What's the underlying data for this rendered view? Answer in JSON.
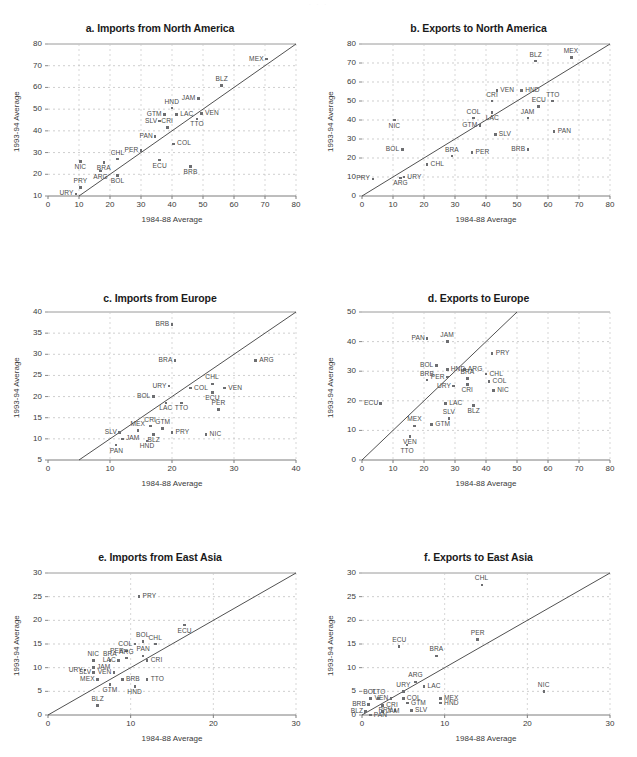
{
  "figure": {
    "top_note": "· · ·",
    "axis_x_label": "1984-88 Average",
    "axis_y_label": "1993-94 Average"
  },
  "chart_data": [
    {
      "id": "a",
      "type": "scatter",
      "title": "a. Imports from North America",
      "xlabel": "1984-88 Average",
      "ylabel": "1993-94 Average",
      "xlim": [
        0,
        80
      ],
      "ylim": [
        10,
        80
      ],
      "xticks": [
        0,
        10,
        20,
        30,
        40,
        50,
        60,
        70,
        80
      ],
      "yticks": [
        10,
        20,
        30,
        40,
        50,
        60,
        70,
        80
      ],
      "grid": true,
      "legend": "none",
      "reference_line": "45-degree identity line y = x",
      "points": [
        {
          "label": "MEX",
          "x": 70.5,
          "y": 73.0,
          "lp": "left"
        },
        {
          "label": "BLZ",
          "x": 56.0,
          "y": 61.0,
          "lp": "above"
        },
        {
          "label": "JAM",
          "x": 48.5,
          "y": 55.0,
          "lp": "left"
        },
        {
          "label": "HND",
          "x": 40.0,
          "y": 50.5,
          "lp": "above"
        },
        {
          "label": "VEN",
          "x": 49.5,
          "y": 48.0,
          "lp": "right"
        },
        {
          "label": "LAC",
          "x": 41.5,
          "y": 47.5,
          "lp": "right"
        },
        {
          "label": "GTM",
          "x": 37.5,
          "y": 47.5,
          "lp": "left"
        },
        {
          "label": "TTO",
          "x": 48.0,
          "y": 45.5,
          "lp": "below"
        },
        {
          "label": "SLV",
          "x": 36.0,
          "y": 44.5,
          "lp": "left"
        },
        {
          "label": "CRI",
          "x": 38.5,
          "y": 41.5,
          "lp": "above"
        },
        {
          "label": "PAN",
          "x": 34.5,
          "y": 37.5,
          "lp": "left"
        },
        {
          "label": "COL",
          "x": 40.5,
          "y": 34.0,
          "lp": "right"
        },
        {
          "label": "PER",
          "x": 30.0,
          "y": 31.0,
          "lp": "left"
        },
        {
          "label": "CHL",
          "x": 22.5,
          "y": 27.0,
          "lp": "above"
        },
        {
          "label": "ECU",
          "x": 36.0,
          "y": 26.5,
          "lp": "below"
        },
        {
          "label": "NIC",
          "x": 10.5,
          "y": 26.0,
          "lp": "below"
        },
        {
          "label": "BRA",
          "x": 18.0,
          "y": 25.5,
          "lp": "below"
        },
        {
          "label": "BRB",
          "x": 46.0,
          "y": 23.5,
          "lp": "below"
        },
        {
          "label": "ARG",
          "x": 17.0,
          "y": 21.5,
          "lp": "below"
        },
        {
          "label": "BOL",
          "x": 22.5,
          "y": 19.5,
          "lp": "below"
        },
        {
          "label": "PRY",
          "x": 10.5,
          "y": 14.0,
          "lp": "above"
        },
        {
          "label": "URY",
          "x": 9.0,
          "y": 11.0,
          "lp": "left"
        }
      ]
    },
    {
      "id": "b",
      "type": "scatter",
      "title": "b. Exports to North America",
      "xlabel": "1984-88 Average",
      "ylabel": "1993-94 Average",
      "xlim": [
        0,
        80
      ],
      "ylim": [
        0,
        80
      ],
      "xticks": [
        0,
        10,
        20,
        30,
        40,
        50,
        60,
        70,
        80
      ],
      "yticks": [
        0,
        10,
        20,
        30,
        40,
        50,
        60,
        70,
        80
      ],
      "grid": true,
      "legend": "none",
      "reference_line": "45-degree identity line y = x",
      "points": [
        {
          "label": "MEX",
          "x": 67.5,
          "y": 73.0,
          "lp": "above"
        },
        {
          "label": "BLZ",
          "x": 56.0,
          "y": 71.0,
          "lp": "above"
        },
        {
          "label": "HND",
          "x": 51.5,
          "y": 55.5,
          "lp": "right"
        },
        {
          "label": "VEN",
          "x": 43.5,
          "y": 55.5,
          "lp": "right"
        },
        {
          "label": "CRI",
          "x": 42.0,
          "y": 50.0,
          "lp": "above"
        },
        {
          "label": "TTO",
          "x": 61.5,
          "y": 50.0,
          "lp": "above"
        },
        {
          "label": "ECU",
          "x": 57.0,
          "y": 47.0,
          "lp": "above"
        },
        {
          "label": "LAC",
          "x": 42.0,
          "y": 44.0,
          "lp": "below"
        },
        {
          "label": "JAM",
          "x": 53.5,
          "y": 41.0,
          "lp": "above"
        },
        {
          "label": "COL",
          "x": 36.0,
          "y": 41.0,
          "lp": "above"
        },
        {
          "label": "NIC",
          "x": 10.5,
          "y": 40.0,
          "lp": "below"
        },
        {
          "label": "GTM",
          "x": 38.0,
          "y": 37.0,
          "lp": "left"
        },
        {
          "label": "PAN",
          "x": 62.0,
          "y": 34.0,
          "lp": "right"
        },
        {
          "label": "SLV",
          "x": 43.0,
          "y": 32.5,
          "lp": "right"
        },
        {
          "label": "BOL",
          "x": 13.0,
          "y": 24.5,
          "lp": "left"
        },
        {
          "label": "BRB",
          "x": 53.5,
          "y": 24.5,
          "lp": "left"
        },
        {
          "label": "PER",
          "x": 35.5,
          "y": 23.0,
          "lp": "right"
        },
        {
          "label": "BRA",
          "x": 29.0,
          "y": 21.0,
          "lp": "above"
        },
        {
          "label": "CHL",
          "x": 21.0,
          "y": 16.5,
          "lp": "right"
        },
        {
          "label": "URY",
          "x": 13.5,
          "y": 10.0,
          "lp": "right"
        },
        {
          "label": "ARG",
          "x": 12.5,
          "y": 9.5,
          "lp": "below"
        },
        {
          "label": "PRY",
          "x": 3.5,
          "y": 9.0,
          "lp": "left"
        }
      ]
    },
    {
      "id": "c",
      "type": "scatter",
      "title": "c. Imports from Europe",
      "xlabel": "1984-88 Average",
      "ylabel": "1993-94 Average",
      "xlim": [
        0,
        40
      ],
      "ylim": [
        5,
        40
      ],
      "xticks": [
        0,
        10,
        20,
        30,
        40
      ],
      "yticks": [
        5,
        10,
        15,
        20,
        25,
        30,
        35,
        40
      ],
      "grid": true,
      "legend": "none",
      "reference_line": "45-degree identity line y = x",
      "points": [
        {
          "label": "BRB",
          "x": 20.0,
          "y": 37.0,
          "lp": "left"
        },
        {
          "label": "BRA",
          "x": 20.5,
          "y": 28.5,
          "lp": "left"
        },
        {
          "label": "ARG",
          "x": 33.5,
          "y": 28.5,
          "lp": "right"
        },
        {
          "label": "CHL",
          "x": 26.5,
          "y": 23.0,
          "lp": "above"
        },
        {
          "label": "URY",
          "x": 19.5,
          "y": 22.5,
          "lp": "left"
        },
        {
          "label": "COL",
          "x": 23.0,
          "y": 22.0,
          "lp": "right"
        },
        {
          "label": "VEN",
          "x": 28.5,
          "y": 22.0,
          "lp": "right"
        },
        {
          "label": "ECU",
          "x": 26.5,
          "y": 21.0,
          "lp": "below"
        },
        {
          "label": "BOL",
          "x": 17.0,
          "y": 20.0,
          "lp": "left"
        },
        {
          "label": "TTO",
          "x": 21.5,
          "y": 18.5,
          "lp": "below"
        },
        {
          "label": "LAC",
          "x": 19.0,
          "y": 18.5,
          "lp": "below"
        },
        {
          "label": "PER",
          "x": 27.5,
          "y": 17.0,
          "lp": "above"
        },
        {
          "label": "CRI",
          "x": 16.5,
          "y": 13.0,
          "lp": "above"
        },
        {
          "label": "GTM",
          "x": 18.5,
          "y": 12.5,
          "lp": "above"
        },
        {
          "label": "MEX",
          "x": 14.5,
          "y": 12.0,
          "lp": "above"
        },
        {
          "label": "BLZ",
          "x": 17.0,
          "y": 11.0,
          "lp": "below"
        },
        {
          "label": "PRY",
          "x": 20.0,
          "y": 11.5,
          "lp": "right"
        },
        {
          "label": "NIC",
          "x": 25.5,
          "y": 11.0,
          "lp": "right"
        },
        {
          "label": "SLV",
          "x": 11.5,
          "y": 11.5,
          "lp": "left"
        },
        {
          "label": "JAM",
          "x": 12.0,
          "y": 10.0,
          "lp": "right"
        },
        {
          "label": "HND",
          "x": 16.0,
          "y": 9.5,
          "lp": "below"
        },
        {
          "label": "PAN",
          "x": 11.0,
          "y": 8.5,
          "lp": "below"
        }
      ]
    },
    {
      "id": "d",
      "type": "scatter",
      "title": "d. Exports to Europe",
      "xlabel": "1984-88 Average",
      "ylabel": "1993-94 Average",
      "xlim": [
        0,
        80
      ],
      "ylim": [
        0,
        50
      ],
      "xticks": [
        0,
        10,
        20,
        30,
        40,
        50,
        60,
        70,
        80
      ],
      "yticks": [
        0,
        10,
        20,
        30,
        40,
        50
      ],
      "grid": true,
      "legend": "none",
      "reference_line": "45-degree identity line y = x",
      "points": [
        {
          "label": "PAN",
          "x": 21.0,
          "y": 41.0,
          "lp": "left"
        },
        {
          "label": "JAM",
          "x": 27.5,
          "y": 40.0,
          "lp": "above"
        },
        {
          "label": "PRY",
          "x": 42.0,
          "y": 36.0,
          "lp": "right"
        },
        {
          "label": "BOL",
          "x": 24.0,
          "y": 32.0,
          "lp": "left"
        },
        {
          "label": "HND",
          "x": 27.5,
          "y": 30.5,
          "lp": "right"
        },
        {
          "label": "ARG",
          "x": 33.0,
          "y": 30.5,
          "lp": "right"
        },
        {
          "label": "CHL",
          "x": 40.0,
          "y": 29.0,
          "lp": "right"
        },
        {
          "label": "PER",
          "x": 27.5,
          "y": 28.0,
          "lp": "left"
        },
        {
          "label": "BRA",
          "x": 34.0,
          "y": 27.5,
          "lp": "above"
        },
        {
          "label": "BRB",
          "x": 21.0,
          "y": 27.0,
          "lp": "above"
        },
        {
          "label": "COL",
          "x": 41.0,
          "y": 26.5,
          "lp": "right"
        },
        {
          "label": "CRI",
          "x": 34.0,
          "y": 25.5,
          "lp": "below"
        },
        {
          "label": "URY",
          "x": 29.5,
          "y": 25.0,
          "lp": "left"
        },
        {
          "label": "NIC",
          "x": 42.5,
          "y": 23.5,
          "lp": "right"
        },
        {
          "label": "ECU",
          "x": 6.0,
          "y": 19.0,
          "lp": "left"
        },
        {
          "label": "LAC",
          "x": 27.0,
          "y": 19.0,
          "lp": "right"
        },
        {
          "label": "BLZ",
          "x": 36.0,
          "y": 18.5,
          "lp": "below"
        },
        {
          "label": "SLV",
          "x": 28.0,
          "y": 14.0,
          "lp": "above"
        },
        {
          "label": "GTM",
          "x": 22.5,
          "y": 12.0,
          "lp": "right"
        },
        {
          "label": "MEX",
          "x": 17.0,
          "y": 11.5,
          "lp": "above"
        },
        {
          "label": "VEN",
          "x": 15.5,
          "y": 8.0,
          "lp": "below"
        },
        {
          "label": "TTO",
          "x": 14.5,
          "y": 5.0,
          "lp": "below"
        }
      ]
    },
    {
      "id": "e",
      "type": "scatter",
      "title": "e. Imports from East Asia",
      "xlabel": "1984-88 Average",
      "ylabel": "1993-94 Average",
      "xlim": [
        0,
        30
      ],
      "ylim": [
        0,
        30
      ],
      "xticks": [
        0,
        10,
        20,
        30
      ],
      "yticks": [
        0,
        5,
        10,
        15,
        20,
        25,
        30
      ],
      "grid": true,
      "legend": "none",
      "reference_line": "45-degree identity line y = x",
      "points": [
        {
          "label": "PRY",
          "x": 11.0,
          "y": 25.0,
          "lp": "right"
        },
        {
          "label": "ECU",
          "x": 16.5,
          "y": 19.0,
          "lp": "below"
        },
        {
          "label": "BOL",
          "x": 11.5,
          "y": 15.5,
          "lp": "above"
        },
        {
          "label": "CHL",
          "x": 13.0,
          "y": 15.0,
          "lp": "above"
        },
        {
          "label": "COL",
          "x": 10.5,
          "y": 15.0,
          "lp": "left"
        },
        {
          "label": "PER",
          "x": 9.5,
          "y": 13.5,
          "lp": "left"
        },
        {
          "label": "PAN",
          "x": 11.5,
          "y": 12.5,
          "lp": "above"
        },
        {
          "label": "ARG",
          "x": 9.5,
          "y": 12.0,
          "lp": "above"
        },
        {
          "label": "LAC",
          "x": 8.5,
          "y": 11.5,
          "lp": "left"
        },
        {
          "label": "CRI",
          "x": 12.0,
          "y": 11.5,
          "lp": "right"
        },
        {
          "label": "BRA",
          "x": 7.5,
          "y": 11.5,
          "lp": "above"
        },
        {
          "label": "NIC",
          "x": 5.5,
          "y": 11.5,
          "lp": "above"
        },
        {
          "label": "VEN",
          "x": 8.0,
          "y": 9.0,
          "lp": "left"
        },
        {
          "label": "JAM",
          "x": 5.5,
          "y": 10.0,
          "lp": "right"
        },
        {
          "label": "URY",
          "x": 4.5,
          "y": 9.5,
          "lp": "left"
        },
        {
          "label": "SLV",
          "x": 5.5,
          "y": 9.0,
          "lp": "left"
        },
        {
          "label": "MEX",
          "x": 6.0,
          "y": 7.5,
          "lp": "left"
        },
        {
          "label": "BRB",
          "x": 9.0,
          "y": 7.5,
          "lp": "right"
        },
        {
          "label": "TTO",
          "x": 12.0,
          "y": 7.5,
          "lp": "right"
        },
        {
          "label": "GTM",
          "x": 7.5,
          "y": 6.5,
          "lp": "below"
        },
        {
          "label": "HND",
          "x": 10.5,
          "y": 6.0,
          "lp": "below"
        },
        {
          "label": "BLZ",
          "x": 6.0,
          "y": 2.0,
          "lp": "above"
        }
      ]
    },
    {
      "id": "f",
      "type": "scatter",
      "title": "f. Exports to East Asia",
      "xlabel": "1984-88 Average",
      "ylabel": "1993-94 Average",
      "xlim": [
        0,
        30
      ],
      "ylim": [
        0,
        30
      ],
      "xticks": [
        0,
        10,
        20,
        30
      ],
      "yticks": [
        0,
        5,
        10,
        15,
        20,
        25,
        30
      ],
      "grid": true,
      "legend": "none",
      "reference_line": "45-degree identity line y = x",
      "points": [
        {
          "label": "CHL",
          "x": 14.5,
          "y": 27.5,
          "lp": "above"
        },
        {
          "label": "PER",
          "x": 14.0,
          "y": 16.0,
          "lp": "above"
        },
        {
          "label": "ECU",
          "x": 4.5,
          "y": 14.5,
          "lp": "above"
        },
        {
          "label": "BRA",
          "x": 9.0,
          "y": 12.5,
          "lp": "above"
        },
        {
          "label": "ARG",
          "x": 6.5,
          "y": 7.0,
          "lp": "above"
        },
        {
          "label": "LAC",
          "x": 7.5,
          "y": 6.0,
          "lp": "right"
        },
        {
          "label": "URY",
          "x": 5.0,
          "y": 5.0,
          "lp": "above"
        },
        {
          "label": "NIC",
          "x": 22.0,
          "y": 5.0,
          "lp": "above"
        },
        {
          "label": "MEX",
          "x": 9.5,
          "y": 3.5,
          "lp": "right"
        },
        {
          "label": "COL",
          "x": 5.0,
          "y": 3.5,
          "lp": "right"
        },
        {
          "label": "VEN",
          "x": 3.5,
          "y": 3.5,
          "lp": "left"
        },
        {
          "label": "TTO",
          "x": 2.0,
          "y": 3.5,
          "lp": "above"
        },
        {
          "label": "BOL",
          "x": 1.0,
          "y": 3.5,
          "lp": "above"
        },
        {
          "label": "HND",
          "x": 9.5,
          "y": 2.5,
          "lp": "right"
        },
        {
          "label": "GTM",
          "x": 5.5,
          "y": 2.5,
          "lp": "right"
        },
        {
          "label": "CRI",
          "x": 2.5,
          "y": 2.0,
          "lp": "right"
        },
        {
          "label": "BRB",
          "x": 0.8,
          "y": 2.2,
          "lp": "left"
        },
        {
          "label": "SLV",
          "x": 6.0,
          "y": 1.0,
          "lp": "right"
        },
        {
          "label": "PRY",
          "x": 4.0,
          "y": 1.0,
          "lp": "left"
        },
        {
          "label": "JAM",
          "x": 2.5,
          "y": 0.7,
          "lp": "right"
        },
        {
          "label": "BLZ",
          "x": 0.4,
          "y": 0.8,
          "lp": "left"
        },
        {
          "label": "PAN",
          "x": 1.0,
          "y": 0.0,
          "lp": "right"
        }
      ]
    }
  ]
}
